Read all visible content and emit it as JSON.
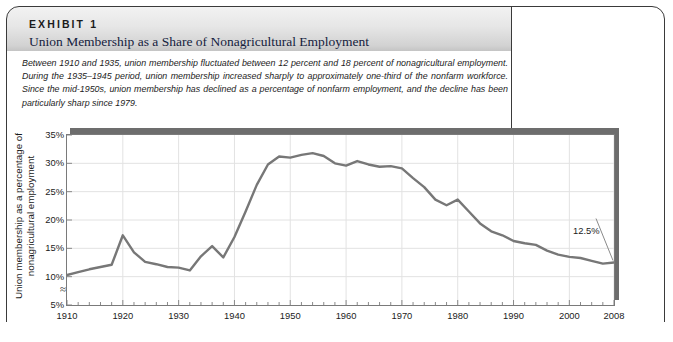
{
  "exhibit": {
    "kicker": "EXHIBIT 1",
    "title": "Union Membership as a Share of Nonagricultural Employment",
    "description": "Between 1910 and 1935, union membership fluctuated between 12 percent and 18 percent of nonagricultural employment. During the 1935–1945 period, union membership increased sharply to approximately one-third of the nonfarm workforce. Since the mid-1950s, union membership has declined as a percentage of nonfarm employment, and the decline has been particularly sharp since 1979."
  },
  "colors": {
    "line": "#777777",
    "grid": "#e2e2e2",
    "plot_border": "#7a7a7a",
    "shadow": "#6d6d6d",
    "header_top": "#f2f2f2",
    "header_bottom": "#c4c4c4",
    "title_text": "#14213d",
    "frame": "#3a3a3a"
  },
  "chart_data": {
    "type": "line",
    "title": "Union Membership as a Share of Nonagricultural Employment",
    "xlabel": "Year",
    "ylabel": "Union membership as a percentage of nonagricultural employment",
    "xlim": [
      1910,
      2008
    ],
    "ylim": [
      5,
      35
    ],
    "yticks": [
      "5%",
      "10%",
      "15%",
      "20%",
      "25%",
      "30%",
      "35%"
    ],
    "ytick_values": [
      5,
      10,
      15,
      20,
      25,
      30,
      35
    ],
    "xticks": [
      "1910",
      "1920",
      "1930",
      "1940",
      "1950",
      "1960",
      "1970",
      "1980",
      "1990",
      "2000",
      "2008"
    ],
    "xtick_values": [
      1910,
      1920,
      1930,
      1940,
      1950,
      1960,
      1970,
      1980,
      1990,
      2000,
      2008
    ],
    "minor_xtick_step": 2,
    "grid": true,
    "legend": false,
    "y_axis_break": true,
    "annotations": [
      {
        "label": "12.5%",
        "x": 2008,
        "y": 12.5
      }
    ],
    "series": [
      {
        "name": "Union membership share",
        "x": [
          1910,
          1912,
          1914,
          1916,
          1918,
          1920,
          1922,
          1924,
          1926,
          1928,
          1930,
          1932,
          1934,
          1936,
          1938,
          1940,
          1942,
          1944,
          1946,
          1948,
          1950,
          1952,
          1954,
          1956,
          1958,
          1960,
          1962,
          1964,
          1966,
          1968,
          1970,
          1972,
          1974,
          1976,
          1978,
          1980,
          1982,
          1984,
          1986,
          1988,
          1990,
          1992,
          1994,
          1996,
          1998,
          2000,
          2002,
          2004,
          2006,
          2008
        ],
        "values": [
          10.3,
          10.8,
          11.3,
          11.7,
          12.1,
          17.3,
          14.3,
          12.6,
          12.2,
          11.7,
          11.6,
          11.1,
          13.6,
          15.4,
          13.4,
          17.0,
          21.5,
          26.2,
          29.8,
          31.2,
          31.0,
          31.5,
          31.8,
          31.3,
          30.0,
          29.6,
          30.4,
          29.8,
          29.4,
          29.5,
          29.1,
          27.4,
          25.8,
          23.6,
          22.6,
          23.6,
          21.5,
          19.4,
          18.0,
          17.3,
          16.3,
          15.9,
          15.6,
          14.6,
          13.9,
          13.5,
          13.3,
          12.8,
          12.3,
          12.5
        ]
      }
    ]
  }
}
